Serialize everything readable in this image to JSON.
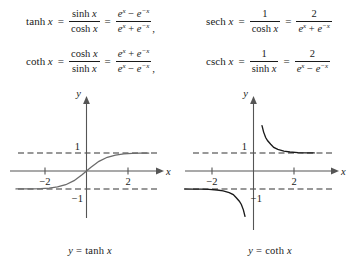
{
  "page": {
    "type": "math-figure"
  },
  "formulas": [
    {
      "id": "tanh",
      "name": "tanh",
      "lhs_func": "tanh",
      "lhs_var": "x",
      "eq1": "=",
      "frac1_num": "sinh x",
      "frac1_den": "cosh x",
      "eq2": "=",
      "frac2_num": "e^x − e^−x",
      "frac2_den": "e^x + e^−x",
      "trailing": ","
    },
    {
      "id": "sech",
      "name": "sech",
      "lhs_func": "sech",
      "lhs_var": "x",
      "eq1": "=",
      "frac1_num": "1",
      "frac1_den": "cosh x",
      "eq2": "=",
      "frac2_num": "2",
      "frac2_den": "e^x + e^−x",
      "trailing": ""
    },
    {
      "id": "coth",
      "name": "coth",
      "lhs_func": "coth",
      "lhs_var": "x",
      "eq1": "=",
      "frac1_num": "cosh x",
      "frac1_den": "sinh x",
      "eq2": "=",
      "frac2_num": "e^x + e^−x",
      "frac2_den": "e^x − e^−x",
      "trailing": ","
    },
    {
      "id": "csch",
      "name": "csch",
      "lhs_func": "csch",
      "lhs_var": "x",
      "eq1": "=",
      "frac1_num": "1",
      "frac1_den": "sinh x",
      "eq2": "=",
      "frac2_num": "2",
      "frac2_den": "e^x − e^−x",
      "trailing": ""
    }
  ],
  "symbols": {
    "e": "e",
    "x": "x",
    "minus": "−",
    "plus": "+",
    "one": "1",
    "two": "2",
    "equals": "=",
    "sinh": "sinh",
    "cosh": "cosh",
    "comma": ","
  },
  "colors": {
    "ink": "#1a1a1a",
    "axis": "#555555",
    "curve_tanh": "#6b6b6b",
    "curve_coth": "#1a1a1a",
    "asymptote": "#333333",
    "background": "#ffffff"
  },
  "chart_data": [
    {
      "type": "line",
      "id": "tanh-plot",
      "title": "y = tanh x",
      "caption_y": "y",
      "caption_eq": "=",
      "caption_fn": "tanh",
      "caption_var": "x",
      "xlabel": "x",
      "ylabel": "y",
      "xlim": [
        -3.4,
        3.0
      ],
      "ylim": [
        -2.1,
        2.4
      ],
      "xticks": [
        -2,
        2
      ],
      "xticklabels": [
        "−2",
        "2"
      ],
      "yticks": [
        1,
        -1
      ],
      "yticklabels": [
        "1",
        "−1"
      ],
      "grid": false,
      "legend": false,
      "asymptotes": [
        {
          "type": "horizontal",
          "value": 1,
          "label": "1",
          "style": "dashed"
        },
        {
          "type": "horizontal",
          "value": -1,
          "label": "−1",
          "style": "dashed"
        }
      ],
      "series": [
        {
          "name": "y = tanh x",
          "color": "#6b6b6b",
          "x": [
            -3.4,
            -3.0,
            -2.6,
            -2.2,
            -1.8,
            -1.4,
            -1.0,
            -0.6,
            -0.2,
            0.0,
            0.2,
            0.6,
            1.0,
            1.4,
            1.8,
            2.2,
            2.6,
            3.0
          ],
          "values": [
            -0.998,
            -0.995,
            -0.989,
            -0.976,
            -0.947,
            -0.885,
            -0.762,
            -0.537,
            -0.197,
            0.0,
            0.197,
            0.537,
            0.762,
            0.885,
            0.947,
            0.976,
            0.989,
            0.995
          ]
        }
      ]
    },
    {
      "type": "line",
      "id": "coth-plot",
      "title": "y = coth x",
      "caption_y": "y",
      "caption_eq": "=",
      "caption_fn": "coth",
      "caption_var": "x",
      "xlabel": "x",
      "ylabel": "y",
      "xlim": [
        -3.4,
        3.0
      ],
      "ylim": [
        -2.1,
        2.4
      ],
      "xticks": [
        -2,
        2
      ],
      "xticklabels": [
        "−2",
        "2"
      ],
      "yticks": [
        1,
        -1
      ],
      "yticklabels": [
        "1",
        "−1"
      ],
      "grid": false,
      "legend": false,
      "asymptotes": [
        {
          "type": "horizontal",
          "value": 1,
          "label": "1",
          "style": "dashed"
        },
        {
          "type": "horizontal",
          "value": -1,
          "label": "−1",
          "style": "dashed"
        },
        {
          "type": "vertical",
          "value": 0,
          "label": "",
          "style": "axis"
        }
      ],
      "series": [
        {
          "name": "y = coth x (x > 0)",
          "color": "#1a1a1a",
          "x": [
            0.42,
            0.5,
            0.6,
            0.7,
            0.85,
            1.0,
            1.2,
            1.5,
            1.8,
            2.2,
            2.6,
            3.0
          ],
          "values": [
            2.52,
            2.16,
            1.86,
            1.68,
            1.49,
            1.313,
            1.199,
            1.105,
            1.057,
            1.025,
            1.011,
            1.005
          ]
        },
        {
          "name": "y = coth x (x < 0)",
          "color": "#1a1a1a",
          "x": [
            -3.4,
            -3.0,
            -2.6,
            -2.2,
            -1.8,
            -1.5,
            -1.2,
            -1.0,
            -0.85,
            -0.7,
            -0.6,
            -0.5,
            -0.42
          ],
          "values": [
            -1.002,
            -1.005,
            -1.011,
            -1.025,
            -1.057,
            -1.105,
            -1.199,
            -1.313,
            -1.49,
            -1.68,
            -1.86,
            -2.16,
            -2.52
          ]
        }
      ]
    }
  ]
}
